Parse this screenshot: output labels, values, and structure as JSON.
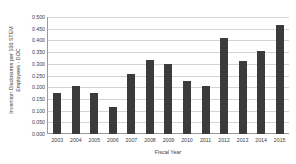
{
  "chart_data": {
    "type": "bar",
    "title": "",
    "xlabel": "Fiscal Year",
    "ylabel": "Invention Disclosures per 100 STEM Employees - DOC",
    "ylabel_lines": [
      "Invention Disclosures per 100 STEM",
      "Employees - DOC"
    ],
    "categories": [
      "2003",
      "2004",
      "2005",
      "2006",
      "2007",
      "2008",
      "2009",
      "2010",
      "2011",
      "2012",
      "2013",
      "2014",
      "2015"
    ],
    "values": [
      0.175,
      0.205,
      0.175,
      0.115,
      0.255,
      0.315,
      0.3,
      0.228,
      0.205,
      0.41,
      0.31,
      0.355,
      0.465
    ],
    "ylim": [
      0.0,
      0.5
    ],
    "ytick_labels": [
      "0.500",
      "0.450",
      "0.400",
      "0.350",
      "0.300",
      "0.250",
      "0.200",
      "0.150",
      "0.100",
      "0.050",
      "0.000"
    ],
    "ytick_values": [
      0.5,
      0.45,
      0.4,
      0.35,
      0.3,
      0.25,
      0.2,
      0.15,
      0.1,
      0.05,
      0.0
    ],
    "grid": true,
    "legend": "none",
    "bar_color": "#3b3b3b",
    "grid_color": "#d4d4d4",
    "axis_color": "#9a9a9a",
    "text_color": "#3c3c3c"
  }
}
